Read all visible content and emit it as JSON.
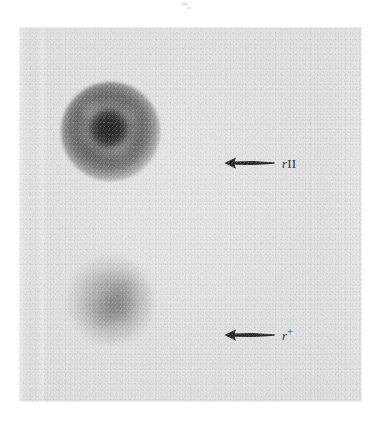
{
  "figure": {
    "plate_background_color": "#e3e3e3",
    "page_background_color": "#ffffff",
    "ink_color": "#2a2a2a"
  },
  "annotations": [
    {
      "id": "rII",
      "arrow_icon": "left-arrow-icon",
      "arrow_direction": "left",
      "label_italic": "r",
      "label_roman": "II",
      "label_superscript": "",
      "label_full": "rII",
      "points_to": "upper-plaque"
    },
    {
      "id": "r-plus",
      "arrow_icon": "left-arrow-icon",
      "arrow_direction": "left",
      "label_italic": "r",
      "label_roman": "",
      "label_superscript": "+",
      "label_full": "r+",
      "points_to": "lower-plaque"
    }
  ],
  "plaques": [
    {
      "id": "upper-plaque",
      "name": "rII plaque",
      "appearance": "large dark disk with sharp edge and darker irregular core"
    },
    {
      "id": "lower-plaque",
      "name": "r+ plaque",
      "appearance": "smaller, lighter, soft diffuse-edged gray blob"
    }
  ],
  "artifacts": {
    "top_smudge": "faint scan smudge above the print"
  }
}
